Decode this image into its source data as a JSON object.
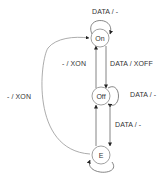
{
  "diagram": {
    "type": "state-machine",
    "states": [
      {
        "id": "on",
        "label": "On"
      },
      {
        "id": "off",
        "label": "Off"
      },
      {
        "id": "e",
        "label": "E"
      }
    ],
    "transitions": [
      {
        "from": "on",
        "to": "on",
        "label": "DATA / -"
      },
      {
        "from": "on",
        "to": "off",
        "label": "DATA / XOFF"
      },
      {
        "from": "off",
        "to": "on",
        "label": "- / XON"
      },
      {
        "from": "off",
        "to": "off",
        "label": "DATA / -"
      },
      {
        "from": "off",
        "to": "e",
        "label": "DATA / -"
      },
      {
        "from": "e",
        "to": "off",
        "label": ""
      },
      {
        "from": "e",
        "to": "e",
        "label": ""
      },
      {
        "from": "e",
        "to": "on",
        "label": "- / XON"
      }
    ],
    "colors": {
      "stroke": "#555555",
      "text": "#333333",
      "background": "#ffffff"
    }
  }
}
